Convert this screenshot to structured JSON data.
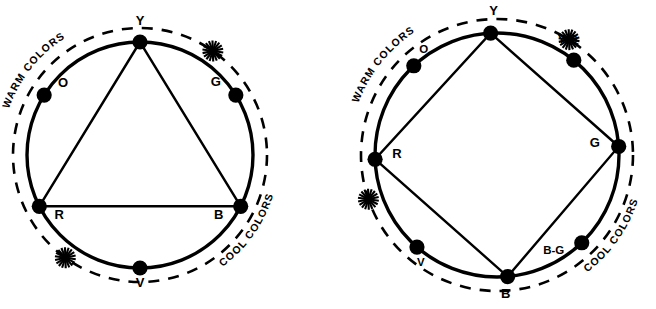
{
  "figure": {
    "background_color": "#ffffff",
    "ink_color": "#000000"
  },
  "wheels": [
    {
      "id": "primary-triad-wheel",
      "name": "six-hue-wheel",
      "center": {
        "x": 140,
        "y": 155
      },
      "radius": 113,
      "dashed_radius": 127,
      "harmony_shape": "triangle",
      "harmony_nodes": [
        "Y",
        "R",
        "B"
      ],
      "nodes": [
        {
          "key": "Y",
          "label": "Y",
          "angle_deg": 90,
          "label_dx": 0,
          "label_dy": 22,
          "size": "lg"
        },
        {
          "key": "G",
          "label": "G",
          "angle_deg": 32,
          "label_dx": -20,
          "label_dy": 14,
          "size": "lg"
        },
        {
          "key": "B",
          "label": "B",
          "angle_deg": -27,
          "label_dx": -22,
          "label_dy": -8,
          "size": "lg"
        },
        {
          "key": "V",
          "label": "V",
          "angle_deg": -90,
          "label_dx": 0,
          "label_dy": -14,
          "size": "lg"
        },
        {
          "key": "R",
          "label": "R",
          "angle_deg": 207,
          "label_dx": 20,
          "label_dy": -8,
          "size": "lg"
        },
        {
          "key": "O",
          "label": "O",
          "angle_deg": 148,
          "label_dx": 19,
          "label_dy": 13,
          "size": "lg"
        }
      ],
      "bands": [
        {
          "key": "warm",
          "label": "WARM COLORS",
          "position": "upper-left"
        },
        {
          "key": "cool",
          "label": "COOL COLORS",
          "position": "lower-right"
        }
      ],
      "starbursts": [
        {
          "key": "warm-cool-divider-top",
          "angle_deg": 55,
          "position": "top-right"
        },
        {
          "key": "warm-cool-divider-bottom",
          "angle_deg": 234,
          "position": "bottom-left"
        }
      ]
    },
    {
      "id": "secondary-tetrad-wheel",
      "name": "eight-hue-wheel",
      "center": {
        "x": 497,
        "y": 155
      },
      "radius": 122,
      "dashed_radius": 136,
      "harmony_shape": "diamond",
      "harmony_nodes": [
        "Y",
        "G",
        "B",
        "R"
      ],
      "nodes": [
        {
          "key": "Y",
          "label": "Y",
          "angle_deg": 93,
          "label_dx": 3,
          "label_dy": 23,
          "size": "lg"
        },
        {
          "key": "Y-G",
          "label": "Y-G",
          "angle_deg": 51,
          "label_dx": -6,
          "label_dy": 22,
          "size": "sm"
        },
        {
          "key": "G",
          "label": "G",
          "angle_deg": 4,
          "label_dx": -24,
          "label_dy": 4,
          "size": "lg"
        },
        {
          "key": "B-G",
          "label": "B-G",
          "angle_deg": -46,
          "label_dx": -28,
          "label_dy": -6,
          "size": "sm"
        },
        {
          "key": "B",
          "label": "B",
          "angle_deg": -85,
          "label_dx": -2,
          "label_dy": -16,
          "size": "lg"
        },
        {
          "key": "V",
          "label": "V",
          "angle_deg": 229,
          "label_dx": 4,
          "label_dy": -14,
          "size": "sm"
        },
        {
          "key": "R",
          "label": "R",
          "angle_deg": 182,
          "label_dx": 22,
          "label_dy": 6,
          "size": "lg"
        },
        {
          "key": "O",
          "label": "O",
          "angle_deg": 133,
          "label_dx": 10,
          "label_dy": 18,
          "size": "sm"
        }
      ],
      "bands": [
        {
          "key": "warm",
          "label": "WARM COLORS",
          "position": "upper-left"
        },
        {
          "key": "cool",
          "label": "COOL COLORS",
          "position": "lower-right"
        }
      ],
      "starbursts": [
        {
          "key": "warm-cool-divider-top",
          "angle_deg": 58,
          "position": "top-right"
        },
        {
          "key": "warm-cool-divider-bottom",
          "angle_deg": 199,
          "position": "left"
        }
      ]
    }
  ],
  "chart_data": {
    "type": "diagram",
    "charts": [
      {
        "name": "Six-hue color wheel with primary triad",
        "hues": [
          "Y",
          "O",
          "R",
          "V",
          "B",
          "G"
        ],
        "hue_angles_deg": [
          90,
          148,
          207,
          270,
          333,
          32
        ],
        "harmony": {
          "shape": "triangle",
          "vertices": [
            "Y",
            "R",
            "B"
          ]
        },
        "annotations": [
          "WARM COLORS",
          "COOL COLORS"
        ],
        "divider_markers": 2
      },
      {
        "name": "Eight-hue color wheel with tetrad",
        "hues": [
          "Y",
          "Y-G",
          "G",
          "B-G",
          "B",
          "V",
          "R",
          "O"
        ],
        "hue_angles_deg": [
          93,
          51,
          4,
          314,
          275,
          229,
          182,
          133
        ],
        "harmony": {
          "shape": "diamond",
          "vertices": [
            "Y",
            "G",
            "B",
            "R"
          ]
        },
        "annotations": [
          "WARM COLORS",
          "COOL COLORS"
        ],
        "divider_markers": 2
      }
    ]
  }
}
